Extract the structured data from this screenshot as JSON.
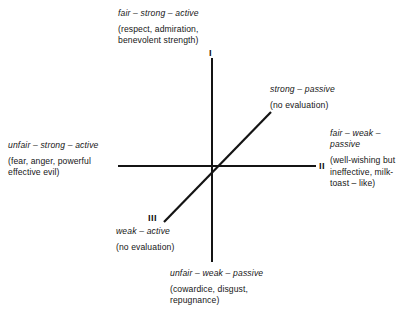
{
  "figure": {
    "line_color": "#141414",
    "background_color": "#ffffff"
  },
  "numerals": {
    "quadrant_one": "I",
    "quadrant_two": "II",
    "quadrant_three": "III"
  },
  "labels": {
    "top": {
      "term": "fair – strong – active",
      "gloss_line1": "(respect, admiration,",
      "gloss_line2": "benevolent strength)"
    },
    "right": {
      "term_line1": "fair – weak –",
      "term_line2": "passive",
      "gloss_line1": "(well-wishing but",
      "gloss_line2": "ineffective, milk-",
      "gloss_line3": "toast – like)"
    },
    "bottom": {
      "term": "unfair – weak – passive",
      "gloss_line1": "(cowardice, disgust,",
      "gloss_line2": "repugnance)"
    },
    "left": {
      "term": "unfair – strong – active",
      "gloss_line1": "(fear, anger, powerful",
      "gloss_line2": "effective evil)"
    },
    "diagonal_upper": {
      "term": "strong – passive",
      "gloss_line1": "(no evaluation)"
    },
    "diagonal_lower": {
      "term": "weak – active",
      "gloss_line1": "(no evaluation)"
    }
  }
}
